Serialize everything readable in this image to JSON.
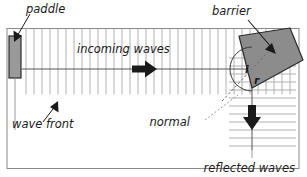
{
  "figure": {
    "background_color": "#ffffff",
    "frame_color": "#8a8a8a",
    "wavefront_color": "#9a9a9a",
    "barrier_fill": "#8c8c8c",
    "barrier_stroke": "#2b2b2b",
    "paddle_fill": "#8c8c8c",
    "paddle_stroke": "#2b2b2b",
    "arrow_color": "#1a1a1a",
    "normal_line_color": "#4d4d4d",
    "text_color": "#1a1a1a"
  },
  "labels": {
    "paddle": "paddle",
    "incoming_waves": "incoming waves",
    "wave_front": "wave front",
    "barrier": "barrier",
    "angle_incidence": "i",
    "angle_reflection": "r",
    "normal": "normal",
    "reflected_waves": "reflected waves"
  },
  "elements": {
    "paddle": {
      "name": "paddle",
      "shape": "vertical-bar"
    },
    "barrier": {
      "name": "barrier",
      "shape": "tilted-slab",
      "angle_deg": 45
    },
    "incoming_wavefronts": {
      "orientation": "vertical",
      "count": 30,
      "direction": "right"
    },
    "reflected_wavefronts": {
      "orientation": "horizontal",
      "count": 8,
      "direction": "down"
    },
    "normal": {
      "style": "dashed",
      "angle_deg": 45
    },
    "angle_arc": {
      "style": "arc",
      "marks": [
        "i",
        "r"
      ]
    }
  }
}
